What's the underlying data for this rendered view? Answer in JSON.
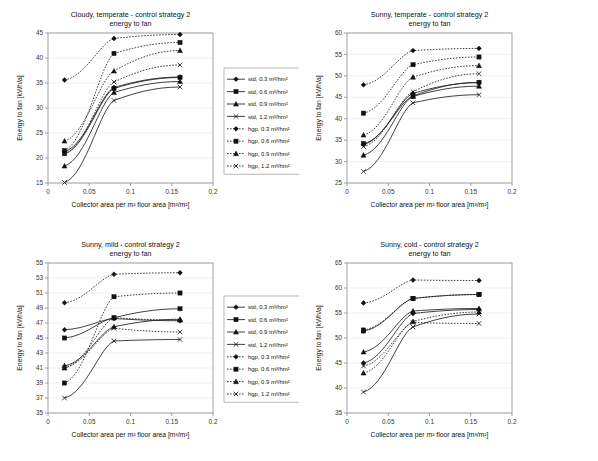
{
  "figure": {
    "axis_x_label": "Collector area per m² floor area [m³/m²]",
    "axis_y_label": "Energy to fan [kWh/a]",
    "subtitle": "energy to fan",
    "series_names": [
      "std, 0.3 m³/hm²",
      "std, 0.6 m³/hm²",
      "std, 0.9 m³/hm²",
      "std, 1.2 m³/hm²",
      "hgp, 0.3 m³/hm²",
      "hgp, 0.6 m³/hm²",
      "hgp, 0.9 m³/hm²",
      "hgp, 1.2 m³/hm²"
    ],
    "series_markers": [
      "diamond",
      "square",
      "triangle",
      "cross",
      "diamond",
      "square",
      "triangle",
      "cross"
    ],
    "series_styles": [
      "solid",
      "solid",
      "solid",
      "solid",
      "dotted",
      "dotted",
      "dotted",
      "dotted"
    ],
    "line_color": "#202020",
    "frame_color": "#8a8a8a"
  },
  "chart_data": [
    {
      "id": "cloudy-temperate",
      "type": "line",
      "title": "Cloudy, temperate - control strategy 2",
      "subtitle": "energy to fan",
      "xlabel": "Collector area per m² floor area [m³/m²]",
      "ylabel": "Energy to fan [kWh/a]",
      "x": [
        0.02,
        0.08,
        0.16
      ],
      "xlim": [
        0,
        0.2
      ],
      "ylim": [
        15,
        45
      ],
      "xticks": [
        0,
        0.05,
        0.1,
        0.15,
        0.2
      ],
      "yticks": [
        15,
        20,
        25,
        30,
        35,
        40,
        45
      ],
      "legend_position": "right-outside",
      "grid": false,
      "series": [
        {
          "name": "std, 0.3 m³/hm²",
          "style": "solid",
          "marker": "diamond",
          "values": [
            21.3,
            34.1,
            36.2
          ]
        },
        {
          "name": "std, 0.6 m³/hm²",
          "style": "solid",
          "marker": "square",
          "values": [
            20.9,
            33.9,
            36.1
          ]
        },
        {
          "name": "std, 0.9 m³/hm²",
          "style": "solid",
          "marker": "triangle",
          "values": [
            18.4,
            33.1,
            35.3
          ]
        },
        {
          "name": "std, 1.2 m³/hm²",
          "style": "solid",
          "marker": "cross",
          "values": [
            15.1,
            31.5,
            34.2
          ]
        },
        {
          "name": "hgp, 0.3 m³/hm²",
          "style": "dotted",
          "marker": "diamond",
          "values": [
            35.6,
            43.9,
            44.7
          ]
        },
        {
          "name": "hgp, 0.6 m³/hm²",
          "style": "dotted",
          "marker": "square",
          "values": [
            21.5,
            40.9,
            43.1
          ]
        },
        {
          "name": "hgp, 0.9 m³/hm²",
          "style": "dotted",
          "marker": "triangle",
          "values": [
            23.4,
            37.4,
            41.5
          ]
        },
        {
          "name": "hgp, 1.2 m³/hm²",
          "style": "dotted",
          "marker": "cross",
          "values": [
            20.8,
            35.2,
            38.6
          ]
        }
      ]
    },
    {
      "id": "sunny-temperate",
      "type": "line",
      "title": "Sunny, temperate - control strategy 2",
      "subtitle": "energy to fan",
      "xlabel": "Collector area per m² floor area [m³/m²]",
      "ylabel": "Energy to fan [kWh/a]",
      "x": [
        0.02,
        0.08,
        0.16
      ],
      "xlim": [
        0,
        0.2
      ],
      "ylim": [
        25,
        60
      ],
      "xticks": [
        0,
        0.05,
        0.1,
        0.15,
        0.2
      ],
      "yticks": [
        25,
        30,
        35,
        40,
        45,
        50,
        55,
        60
      ],
      "legend_position": "none",
      "grid": false,
      "series": [
        {
          "name": "std, 0.3 m³/hm²",
          "style": "solid",
          "marker": "diamond",
          "values": [
            34.0,
            45.9,
            48.4
          ]
        },
        {
          "name": "std, 0.6 m³/hm²",
          "style": "solid",
          "marker": "square",
          "values": [
            34.2,
            45.3,
            48.5
          ]
        },
        {
          "name": "std, 0.9 m³/hm²",
          "style": "solid",
          "marker": "triangle",
          "values": [
            31.5,
            45.2,
            47.6
          ]
        },
        {
          "name": "std, 1.2 m³/hm²",
          "style": "solid",
          "marker": "cross",
          "values": [
            27.7,
            43.7,
            45.6
          ]
        },
        {
          "name": "hgp, 0.3 m³/hm²",
          "style": "dotted",
          "marker": "diamond",
          "values": [
            47.9,
            55.9,
            56.4
          ]
        },
        {
          "name": "hgp, 0.6 m³/hm²",
          "style": "dotted",
          "marker": "square",
          "values": [
            41.3,
            52.6,
            54.4
          ]
        },
        {
          "name": "hgp, 0.9 m³/hm²",
          "style": "dotted",
          "marker": "triangle",
          "values": [
            36.2,
            49.7,
            52.4
          ]
        },
        {
          "name": "hgp, 1.2 m³/hm²",
          "style": "dotted",
          "marker": "cross",
          "values": [
            33.5,
            46.3,
            50.5
          ]
        }
      ]
    },
    {
      "id": "sunny-mild",
      "type": "line",
      "title": "Sunny, mild - control strategy 2",
      "subtitle": "energy to fan",
      "xlabel": "Collector area per m² floor area [m³/m²]",
      "ylabel": "Energy to fan [kWh/a]",
      "x": [
        0.02,
        0.08,
        0.16
      ],
      "xlim": [
        0,
        0.2
      ],
      "ylim": [
        35,
        55
      ],
      "xticks": [
        0,
        0.05,
        0.1,
        0.15,
        0.2
      ],
      "yticks": [
        35,
        37,
        39,
        41,
        43,
        45,
        47,
        49,
        51,
        53,
        55
      ],
      "legend_position": "right-outside",
      "grid": false,
      "series": [
        {
          "name": "std, 0.3 m³/hm²",
          "style": "solid",
          "marker": "diamond",
          "values": [
            46.1,
            47.6,
            47.3
          ]
        },
        {
          "name": "std, 0.6 m³/hm²",
          "style": "solid",
          "marker": "square",
          "values": [
            45.0,
            47.7,
            48.9
          ]
        },
        {
          "name": "std, 0.9 m³/hm²",
          "style": "solid",
          "marker": "triangle",
          "values": [
            41.3,
            46.5,
            47.5
          ]
        },
        {
          "name": "std, 1.2 m³/hm²",
          "style": "solid",
          "marker": "cross",
          "values": [
            37.0,
            44.6,
            44.8
          ]
        },
        {
          "name": "hgp, 0.3 m³/hm²",
          "style": "dotted",
          "marker": "diamond",
          "values": [
            49.7,
            53.5,
            53.7
          ]
        },
        {
          "name": "hgp, 0.6 m³/hm²",
          "style": "dotted",
          "marker": "square",
          "values": [
            39.0,
            50.5,
            51.0
          ]
        },
        {
          "name": "hgp, 0.9 m³/hm²",
          "style": "dotted",
          "marker": "triangle",
          "values": [
            41.0,
            47.7,
            47.4
          ]
        },
        {
          "name": "hgp, 1.2 m³/hm²",
          "style": "dotted",
          "marker": "cross",
          "values": [
            41.1,
            46.3,
            45.8
          ]
        }
      ]
    },
    {
      "id": "sunny-cold",
      "type": "line",
      "title": "Sunny, cold - control strategy 2",
      "subtitle": "energy to fan",
      "xlabel": "Collector area per m² floor area [m³/m²]",
      "ylabel": "Energy to fan [kWh/a]",
      "x": [
        0.02,
        0.08,
        0.16
      ],
      "xlim": [
        0,
        0.2
      ],
      "ylim": [
        35,
        65
      ],
      "xticks": [
        0,
        0.05,
        0.1,
        0.15,
        0.2
      ],
      "yticks": [
        35,
        40,
        45,
        50,
        55,
        60,
        65
      ],
      "legend_position": "none",
      "grid": false,
      "series": [
        {
          "name": "std, 0.3 m³/hm²",
          "style": "solid",
          "marker": "diamond",
          "values": [
            45.0,
            54.9,
            55.7
          ]
        },
        {
          "name": "std, 0.6 m³/hm²",
          "style": "solid",
          "marker": "square",
          "values": [
            51.4,
            57.9,
            58.7
          ]
        },
        {
          "name": "std, 0.9 m³/hm²",
          "style": "solid",
          "marker": "triangle",
          "values": [
            47.2,
            55.4,
            55.9
          ]
        },
        {
          "name": "std, 1.2 m³/hm²",
          "style": "solid",
          "marker": "cross",
          "values": [
            39.2,
            52.2,
            54.8
          ]
        },
        {
          "name": "hgp, 0.3 m³/hm²",
          "style": "dotted",
          "marker": "diamond",
          "values": [
            57.0,
            61.6,
            61.5
          ]
        },
        {
          "name": "hgp, 0.6 m³/hm²",
          "style": "dotted",
          "marker": "square",
          "values": [
            51.6,
            57.9,
            58.7
          ]
        },
        {
          "name": "hgp, 0.9 m³/hm²",
          "style": "dotted",
          "marker": "triangle",
          "values": [
            43.0,
            53.3,
            55.2
          ]
        },
        {
          "name": "hgp, 1.2 m³/hm²",
          "style": "dotted",
          "marker": "cross",
          "values": [
            44.4,
            53.1,
            52.9
          ]
        }
      ]
    }
  ]
}
